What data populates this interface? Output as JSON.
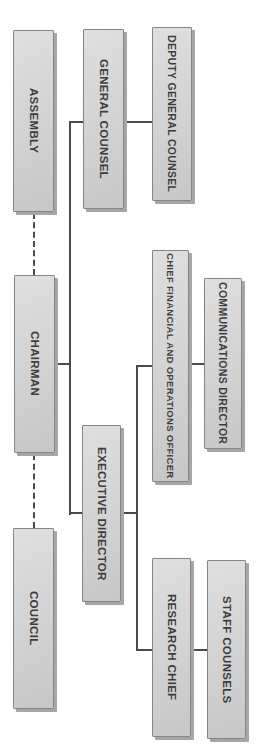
{
  "diagram": {
    "type": "org-chart",
    "orientation": "rotated-90-clockwise-vertical-text",
    "colors": {
      "background": "#ffffff",
      "box_fill": "#d2d2d2",
      "box_border": "#858585",
      "box_shadow": "#a6a6a6",
      "line": "#4a4a4a",
      "text": "#3d3d3d"
    },
    "nodes": [
      {
        "id": "assembly",
        "label": "ASSEMBLY"
      },
      {
        "id": "general-counsel",
        "label": "GENERAL COUNSEL"
      },
      {
        "id": "deputy-general-counsel",
        "label": "DEPUTY GENERAL COUNSEL"
      },
      {
        "id": "chairman",
        "label": "CHAIRMAN"
      },
      {
        "id": "cfoo",
        "label": "CHIEF FINANCIAL AND OPERATIONS OFFICER"
      },
      {
        "id": "communications-director",
        "label": "COMMUNICATIONS DIRECTOR"
      },
      {
        "id": "executive-director",
        "label": "EXECUTIVE DIRECTOR"
      },
      {
        "id": "council",
        "label": "COUNCIL"
      },
      {
        "id": "research-chief",
        "label": "RESEARCH CHIEF"
      },
      {
        "id": "staff-counsels",
        "label": "STAFF COUNSELS"
      }
    ],
    "edges": [
      {
        "from": "assembly",
        "to": "chairman",
        "style": "dashed"
      },
      {
        "from": "chairman",
        "to": "council",
        "style": "dashed"
      },
      {
        "from": "chairman",
        "to": "general-counsel",
        "style": "solid"
      },
      {
        "from": "general-counsel",
        "to": "deputy-general-counsel",
        "style": "solid"
      },
      {
        "from": "chairman",
        "to": "executive-director",
        "style": "solid"
      },
      {
        "from": "executive-director",
        "to": "cfoo",
        "style": "solid"
      },
      {
        "from": "cfoo",
        "to": "communications-director",
        "style": "solid"
      },
      {
        "from": "executive-director",
        "to": "research-chief",
        "style": "solid"
      },
      {
        "from": "research-chief",
        "to": "staff-counsels",
        "style": "solid"
      }
    ]
  }
}
